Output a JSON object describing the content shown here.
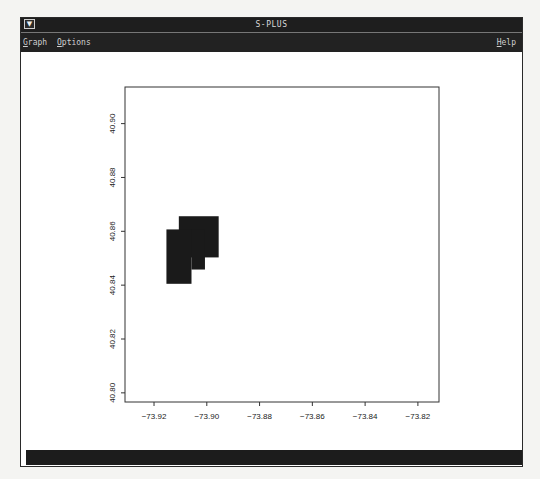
{
  "window": {
    "title": "S-PLUS",
    "window_menu_icon": "triangle-down-icon"
  },
  "menubar": {
    "items": [
      {
        "label": "Graph",
        "mnemonic": "G",
        "rest": "raph"
      },
      {
        "label": "Options",
        "mnemonic": "O",
        "rest": "ptions"
      }
    ],
    "help": {
      "label": "Help",
      "mnemonic": "H",
      "rest": "elp"
    }
  },
  "colors": {
    "chrome": "#1e1e1e",
    "plot_fill": "#1a1a1a",
    "axis": "#333333"
  },
  "chart_data": {
    "type": "image",
    "title": "",
    "xlabel": "",
    "ylabel": "",
    "xlim": [
      -73.931,
      -73.812
    ],
    "ylim": [
      40.7966,
      40.9136
    ],
    "x_ticks": [
      -73.92,
      -73.9,
      -73.88,
      -73.86,
      -73.84,
      -73.82
    ],
    "x_tick_labels": [
      "-73.92",
      "-73.90",
      "-73.88",
      "-73.86",
      "-73.84",
      "-73.82"
    ],
    "y_ticks": [
      40.8,
      40.82,
      40.84,
      40.86,
      40.88,
      40.9
    ],
    "y_tick_labels": [
      "40.80",
      "40.82",
      "40.84",
      "40.86",
      "40.88",
      "40.90"
    ],
    "grid": false,
    "legend": null,
    "filled_regions": [
      {
        "name": "upper-block",
        "x0": -73.9106,
        "x1": -73.8955,
        "y0": 40.8503,
        "y1": 40.8656
      },
      {
        "name": "left-block",
        "x0": -73.9153,
        "x1": -73.9058,
        "y0": 40.8405,
        "y1": 40.8607
      },
      {
        "name": "middle-step",
        "x0": -73.9058,
        "x1": -73.9007,
        "y0": 40.8458,
        "y1": 40.8607
      }
    ]
  }
}
